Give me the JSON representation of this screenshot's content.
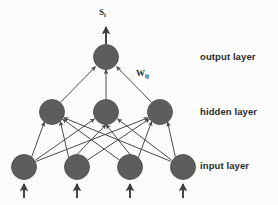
{
  "diagram": {
    "background_color": "#fcfcfc",
    "node_fill_color": "#5d5d5d",
    "node_stroke_color": "#4a4a4a",
    "edge_color": "#4a4a4a",
    "text_color": "#2b2b2b",
    "labels": {
      "output_layer": "output layer",
      "hidden_layer": "hidden layer",
      "input_layer": "input layer",
      "output_signal": "S",
      "output_signal_subscript": "i",
      "weight": "W",
      "weight_subscript": "ij"
    },
    "layers": [
      {
        "name": "output",
        "label": "output layer",
        "node_count": 1,
        "node_radius": 12.5,
        "y": 57,
        "nodes": [
          {
            "id": "out-1",
            "cx": 106,
            "cy": 57
          }
        ]
      },
      {
        "name": "hidden",
        "label": "hidden layer",
        "node_count": 3,
        "node_radius": 12.5,
        "y": 112,
        "nodes": [
          {
            "id": "hid-1",
            "cx": 52,
            "cy": 112
          },
          {
            "id": "hid-2",
            "cx": 106,
            "cy": 112
          },
          {
            "id": "hid-3",
            "cx": 160,
            "cy": 112
          }
        ]
      },
      {
        "name": "input",
        "label": "input layer",
        "node_count": 4,
        "node_radius": 12.5,
        "y": 167,
        "nodes": [
          {
            "id": "in-1",
            "cx": 24,
            "cy": 167
          },
          {
            "id": "in-2",
            "cx": 77,
            "cy": 167
          },
          {
            "id": "in-3",
            "cx": 130,
            "cy": 167
          },
          {
            "id": "in-4",
            "cx": 183,
            "cy": 167
          }
        ]
      }
    ],
    "input_arrows": [
      {
        "x": 24,
        "y_from": 198,
        "y_to": 182
      },
      {
        "x": 77,
        "y_from": 198,
        "y_to": 182
      },
      {
        "x": 130,
        "y_from": 198,
        "y_to": 182
      },
      {
        "x": 183,
        "y_from": 198,
        "y_to": 182
      }
    ],
    "output_arrow": {
      "x": 106,
      "y_from": 44,
      "y_to": 26
    },
    "edges_input_to_hidden": [
      {
        "from": "in-1",
        "to": "hid-1"
      },
      {
        "from": "in-1",
        "to": "hid-2"
      },
      {
        "from": "in-1",
        "to": "hid-3"
      },
      {
        "from": "in-2",
        "to": "hid-1"
      },
      {
        "from": "in-2",
        "to": "hid-2"
      },
      {
        "from": "in-2",
        "to": "hid-3"
      },
      {
        "from": "in-3",
        "to": "hid-1"
      },
      {
        "from": "in-3",
        "to": "hid-2"
      },
      {
        "from": "in-3",
        "to": "hid-3"
      },
      {
        "from": "in-4",
        "to": "hid-1"
      },
      {
        "from": "in-4",
        "to": "hid-2"
      },
      {
        "from": "in-4",
        "to": "hid-3"
      }
    ],
    "edges_hidden_to_output": [
      {
        "from": "hid-1",
        "to": "out-1"
      },
      {
        "from": "hid-2",
        "to": "out-1"
      },
      {
        "from": "hid-3",
        "to": "out-1",
        "weight_label": "W"
      }
    ]
  }
}
